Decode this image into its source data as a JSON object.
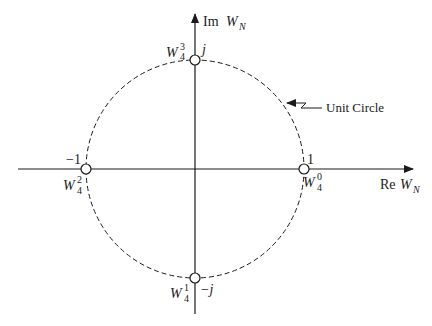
{
  "diagram": {
    "axes": {
      "real_label": "Re",
      "imag_label": "Im",
      "var": "W",
      "var_sub": "N"
    },
    "circle_label": "Unit Circle",
    "points": [
      {
        "name": "W40",
        "base": "W",
        "sub": "4",
        "sup": "0",
        "value": "1"
      },
      {
        "name": "W41",
        "base": "W",
        "sub": "4",
        "sup": "1",
        "value": "−j"
      },
      {
        "name": "W42",
        "base": "W",
        "sub": "4",
        "sup": "2",
        "value": "−1"
      },
      {
        "name": "W43",
        "base": "W",
        "sub": "4",
        "sup": "3",
        "value": "j"
      }
    ],
    "colors": {
      "line": "#1a1a1a",
      "background": "#ffffff"
    }
  }
}
